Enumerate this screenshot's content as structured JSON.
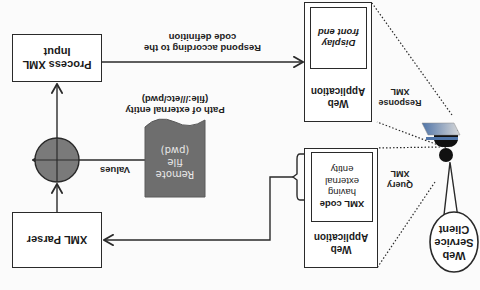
{
  "diagram": {
    "orientation": "rotated 180 degrees",
    "nodes": {
      "process_input": {
        "line1": "Process  XML",
        "line2": "Input"
      },
      "xml_parser": {
        "label": "XML Parser"
      },
      "remote_file": {
        "line1": "Remote",
        "line2": "file",
        "line3": "(pwd)"
      },
      "web_app_response": {
        "title_line1": "Web",
        "title_line2": "Application",
        "inner_line1": "Display",
        "inner_line2": "front end"
      },
      "web_app_query": {
        "title_line1": "Web",
        "title_line2": "Application",
        "inner_line1": "XML code",
        "inner_line2": "having",
        "inner_line3": "external",
        "inner_line4": "entity"
      },
      "client": {
        "line1": "Web",
        "line2": "Service",
        "line3": "Client"
      }
    },
    "edges": {
      "respond": {
        "line1": "Respond  according to the",
        "line2": "code definition"
      },
      "path": {
        "line1": "Path of external  entity",
        "line2": "(file:///etc/pwd)"
      },
      "values": {
        "label": "Values"
      },
      "response_xml": {
        "line1": "Response",
        "line2": "XML"
      },
      "query_xml": {
        "line1": "Query",
        "line2": "XML"
      }
    },
    "colors": {
      "stroke": "#2a2a2a",
      "remote_file_fill": "#6e6e6e",
      "circle_fill": "#7a7a7a",
      "monitor_gradient_start": "#4f74a8",
      "monitor_gradient_end": "#d9d9d9",
      "person_fill": "#111111"
    }
  }
}
